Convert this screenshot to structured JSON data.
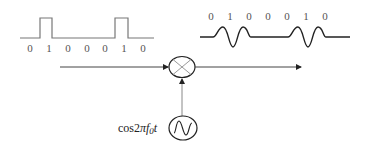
{
  "diagram": {
    "title": "",
    "baseband_signal": {
      "type": "square-wave",
      "bits": [
        "0",
        "1",
        "0",
        "0",
        "0",
        "1",
        "0"
      ]
    },
    "modulated_signal": {
      "type": "carrier-bursts",
      "bits": [
        "0",
        "1",
        "0",
        "0",
        "0",
        "1",
        "0"
      ]
    },
    "multiplier": {
      "symbol": "mixer",
      "icon": "multiply-circle-icon"
    },
    "oscillator": {
      "icon": "sine-oscillator-icon",
      "label_main": "cos2",
      "label_pi": "π",
      "label_f": "f",
      "label_sub": "0",
      "label_t": "t"
    },
    "colors": {
      "line": "#3a3a3a",
      "light_line": "#8a8a8a",
      "text": "#555555"
    }
  }
}
